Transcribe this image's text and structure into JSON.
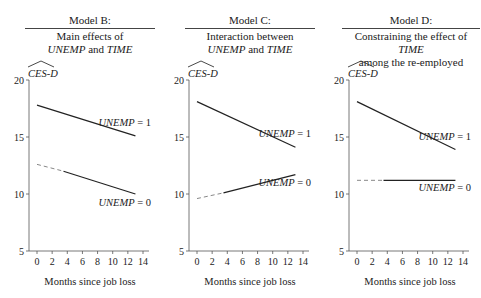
{
  "chart_data": [
    {
      "type": "line",
      "title": "Model B:",
      "subtitle": [
        "Main effects of",
        "UNEMP and TIME"
      ],
      "ylabel": "CES-D (predicted)",
      "ylabel_text": "CES-D",
      "xlabel": "Months since job loss",
      "xlim": [
        0,
        14
      ],
      "ylim": [
        5,
        20
      ],
      "xticks": [
        0,
        2,
        4,
        6,
        8,
        10,
        12,
        14
      ],
      "yticks": [
        5,
        10,
        15,
        20
      ],
      "grid": false,
      "series": [
        {
          "name": "UNEMP = 1",
          "x": [
            0,
            13
          ],
          "y": [
            17.8,
            15.1
          ],
          "style": "solid"
        },
        {
          "name": "UNEMP = 0",
          "x": [
            0,
            3.5,
            13
          ],
          "y": [
            12.6,
            12.0,
            10.0
          ],
          "style": "dashed-then-solid",
          "dashed_until": 3.5
        }
      ]
    },
    {
      "type": "line",
      "title": "Model C:",
      "subtitle": [
        "Interaction between",
        "UNEMP and TIME"
      ],
      "ylabel": "CES-D (predicted)",
      "ylabel_text": "CES-D",
      "xlabel": "Months since job loss",
      "xlim": [
        0,
        14
      ],
      "ylim": [
        5,
        20
      ],
      "xticks": [
        0,
        2,
        4,
        6,
        8,
        10,
        12,
        14
      ],
      "yticks": [
        5,
        10,
        15,
        20
      ],
      "grid": false,
      "series": [
        {
          "name": "UNEMP = 1",
          "x": [
            0,
            13
          ],
          "y": [
            18.1,
            14.1
          ],
          "style": "solid"
        },
        {
          "name": "UNEMP = 0",
          "x": [
            0,
            3.5,
            13
          ],
          "y": [
            9.6,
            10.1,
            11.7
          ],
          "style": "dashed-then-solid",
          "dashed_until": 3.5
        }
      ]
    },
    {
      "type": "line",
      "title": "Model D:",
      "subtitle": [
        "Constraining the effect of TIME",
        "among the re-employed"
      ],
      "ylabel": "CES-D (predicted)",
      "ylabel_text": "CES-D",
      "xlabel": "Months since job loss",
      "xlim": [
        0,
        14
      ],
      "ylim": [
        5,
        20
      ],
      "xticks": [
        0,
        2,
        4,
        6,
        8,
        10,
        12,
        14
      ],
      "yticks": [
        5,
        10,
        15,
        20
      ],
      "grid": false,
      "series": [
        {
          "name": "UNEMP = 1",
          "x": [
            0,
            13
          ],
          "y": [
            18.1,
            13.9
          ],
          "style": "solid"
        },
        {
          "name": "UNEMP = 0",
          "x": [
            0,
            3.5,
            13
          ],
          "y": [
            11.2,
            11.2,
            11.2
          ],
          "style": "dashed-then-solid",
          "dashed_until": 3.5
        }
      ]
    }
  ],
  "panels": [
    {
      "title": "Model B:",
      "sub1": "Main effects of",
      "sub2_a": "UNEMP",
      "sub2_b": " and ",
      "sub2_c": "TIME"
    },
    {
      "title": "Model C:",
      "sub1": "Interaction between",
      "sub2_a": "UNEMP",
      "sub2_b": " and ",
      "sub2_c": "TIME"
    },
    {
      "title": "Model D:",
      "sub1_a": "Constraining the effect of ",
      "sub1_b": "TIME",
      "sub2": "among the re-employed"
    }
  ],
  "labels": {
    "ylabel": "CES-D",
    "xlabel": "Months since job loss",
    "unemp1": "UNEMP = 1",
    "unemp0": "UNEMP = 0"
  }
}
